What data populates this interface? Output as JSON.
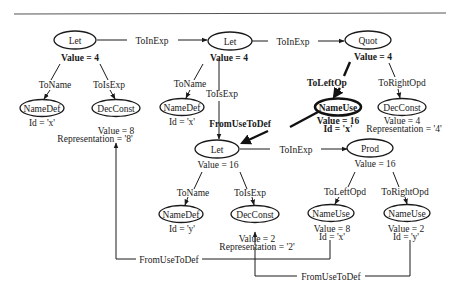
{
  "diagram": {
    "type": "attributed syntax tree",
    "colors": {
      "ink": "#1a1a1a",
      "background": "#ffffff",
      "rule": "#555555"
    },
    "nodes": [
      {
        "id": "let1",
        "label": "Let",
        "attrs": [
          "Value = 4"
        ]
      },
      {
        "id": "namedef1",
        "label": "NameDef",
        "attrs": [
          "Id = 'x'"
        ]
      },
      {
        "id": "decconst1",
        "label": "DecConst",
        "attrs": [
          "Value = 8",
          "Representation = '8'"
        ]
      },
      {
        "id": "let2",
        "label": "Let",
        "attrs": [
          "Value = 4"
        ]
      },
      {
        "id": "namedef2",
        "label": "NameDef",
        "attrs": [
          "Id = 'x'"
        ]
      },
      {
        "id": "quot",
        "label": "Quot",
        "attrs": [
          "Value = 4"
        ]
      },
      {
        "id": "nameuse1",
        "label": "NameUse",
        "attrs": [
          "Value = 16",
          "Id = 'x'"
        ],
        "highlighted": true
      },
      {
        "id": "decconst2",
        "label": "DecConst",
        "attrs": [
          "Value = 4",
          "Representation = '4'"
        ]
      },
      {
        "id": "let3",
        "label": "Let",
        "attrs": [
          "Value = 16"
        ]
      },
      {
        "id": "namedef3",
        "label": "NameDef",
        "attrs": [
          "Id = 'y'"
        ]
      },
      {
        "id": "decconst3",
        "label": "DecConst",
        "attrs": [
          "Value = 2",
          "Representation = '2'"
        ]
      },
      {
        "id": "prod",
        "label": "Prod",
        "attrs": [
          "Value = 16"
        ]
      },
      {
        "id": "nameuse2",
        "label": "NameUse",
        "attrs": [
          "Value = 8",
          "Id = 'x'"
        ]
      },
      {
        "id": "nameuse3",
        "label": "NameUse",
        "attrs": [
          "Value = 2",
          "Id = 'y'"
        ]
      }
    ],
    "edges": [
      {
        "from": "let1",
        "to": "let2",
        "label": "ToInExp"
      },
      {
        "from": "let1",
        "to": "namedef1",
        "label": "ToName"
      },
      {
        "from": "let1",
        "to": "decconst1",
        "label": "ToIsExp"
      },
      {
        "from": "let2",
        "to": "quot",
        "label": "ToInExp"
      },
      {
        "from": "let2",
        "to": "namedef2",
        "label": "ToName"
      },
      {
        "from": "let2",
        "to": "let3",
        "label": "ToIsExp"
      },
      {
        "from": "quot",
        "to": "nameuse1",
        "label": "ToLeftOp"
      },
      {
        "from": "quot",
        "to": "decconst2",
        "label": "ToRightOpd"
      },
      {
        "from": "nameuse1",
        "to": "let3",
        "label": "FromUseToDef",
        "highlighted": true
      },
      {
        "from": "let3",
        "to": "prod",
        "label": "ToInExp"
      },
      {
        "from": "let3",
        "to": "namedef3",
        "label": "ToName"
      },
      {
        "from": "let3",
        "to": "decconst3",
        "label": "ToIsExp"
      },
      {
        "from": "prod",
        "to": "nameuse2",
        "label": "ToLeftOpd"
      },
      {
        "from": "prod",
        "to": "nameuse3",
        "label": "ToRightOpd"
      },
      {
        "from": "nameuse2",
        "to": "decconst1",
        "label": "FromUseToDef"
      },
      {
        "from": "nameuse3",
        "to": "decconst3",
        "label": "FromUseToDef"
      }
    ]
  }
}
